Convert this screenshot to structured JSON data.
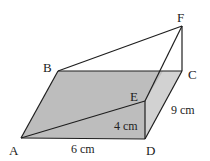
{
  "figure": {
    "type": "3d-wedge-prism",
    "colors": {
      "base_fill": "#bdbdbd",
      "side_fill": "#d2d2d2",
      "stroke": "#1e1e1e",
      "background": "#ffffff"
    },
    "vertices": {
      "A": {
        "label": "A",
        "x": 21,
        "y": 138,
        "label_x": 9,
        "label_y": 155
      },
      "B": {
        "label": "B",
        "x": 58,
        "y": 71,
        "label_x": 44,
        "label_y": 71
      },
      "C": {
        "label": "C",
        "x": 182,
        "y": 71,
        "label_x": 188,
        "label_y": 79
      },
      "D": {
        "label": "D",
        "x": 145,
        "y": 139,
        "label_x": 146,
        "label_y": 155
      },
      "E": {
        "label": "E",
        "x": 145,
        "y": 101,
        "label_x": 130,
        "label_y": 101
      },
      "F": {
        "label": "F",
        "x": 182,
        "y": 26,
        "label_x": 177,
        "label_y": 22
      }
    },
    "dimensions": [
      {
        "id": "AD",
        "text": "6 cm",
        "x": 71,
        "y": 153
      },
      {
        "id": "ED",
        "text": "4 cm",
        "x": 113,
        "y": 129
      },
      {
        "id": "DC",
        "text": "9 cm",
        "x": 171,
        "y": 113
      }
    ]
  }
}
